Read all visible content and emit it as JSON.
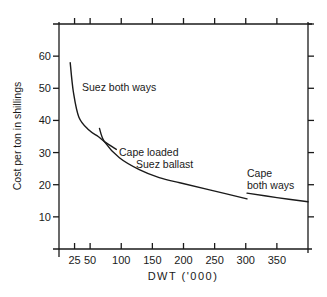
{
  "chart_data": {
    "type": "line",
    "title": "",
    "xlabel": "DWT ('000)",
    "ylabel": "Cost per ton in shillings",
    "xlim": [
      0,
      400
    ],
    "ylim": [
      0,
      70
    ],
    "x_ticks": [
      25,
      50,
      100,
      150,
      200,
      250,
      300,
      350
    ],
    "x_tick_labels": [
      "25",
      "50",
      "100",
      "150",
      "200",
      "250",
      "300",
      "350"
    ],
    "y_ticks": [
      10,
      20,
      30,
      40,
      50,
      60
    ],
    "y_tick_labels": [
      "10",
      "20",
      "30",
      "40",
      "50",
      "60"
    ],
    "grid": false,
    "legend": "inline labels",
    "series": [
      {
        "name": "Suez both ways",
        "x": [
          18,
          23,
          32,
          48,
          63,
          73,
          92
        ],
        "y": [
          58,
          49,
          41,
          37,
          35,
          33.4,
          31
        ]
      },
      {
        "name": "Cape loaded Suez ballast",
        "x": [
          65,
          73,
          97,
          129,
          161,
          194,
          242,
          302
        ],
        "y": [
          37.5,
          33.4,
          28.4,
          24.7,
          22.2,
          20.6,
          18.4,
          15.6
        ]
      },
      {
        "name": "Cape both ways",
        "x": [
          302,
          350,
          400
        ],
        "y": [
          17.4,
          16.0,
          14.7
        ]
      }
    ],
    "annotations": [
      {
        "text": "Suez both ways",
        "x": 82,
        "y": 91
      },
      {
        "text": "Cape loaded",
        "x": 119,
        "y": 156
      },
      {
        "text": "Suez ballast",
        "x": 136,
        "y": 168
      },
      {
        "text": "Cape",
        "x": 247,
        "y": 177
      },
      {
        "text": "both ways",
        "x": 247,
        "y": 189
      }
    ]
  }
}
